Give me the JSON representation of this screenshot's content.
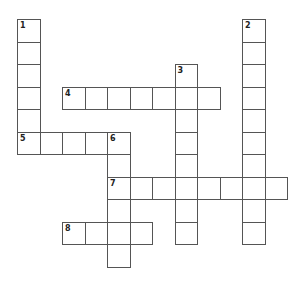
{
  "puzzle": {
    "type": "crossword",
    "cell_size": 22.5,
    "origin": {
      "x": 17,
      "y": 19
    },
    "colors": {
      "border": "#555555",
      "background": "#ffffff",
      "number": "#222222"
    },
    "words": [
      {
        "number": "1",
        "direction": "down",
        "row": 0,
        "col": 0,
        "length": 6
      },
      {
        "number": "2",
        "direction": "down",
        "row": 0,
        "col": 10,
        "length": 10
      },
      {
        "number": "3",
        "direction": "down",
        "row": 2,
        "col": 7,
        "length": 8
      },
      {
        "number": "4",
        "direction": "across",
        "row": 3,
        "col": 2,
        "length": 7
      },
      {
        "number": "5",
        "direction": "across",
        "row": 5,
        "col": 0,
        "length": 5
      },
      {
        "number": "6",
        "direction": "down",
        "row": 5,
        "col": 4,
        "length": 6
      },
      {
        "number": "7",
        "direction": "across",
        "row": 7,
        "col": 4,
        "length": 8
      },
      {
        "number": "8",
        "direction": "across",
        "row": 9,
        "col": 2,
        "length": 4
      }
    ]
  }
}
